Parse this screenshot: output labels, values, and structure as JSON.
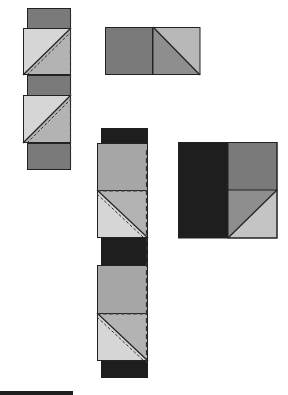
{
  "diagram": {
    "title": "",
    "type": "quilt-assembly-diagram",
    "colors": {
      "black": "#1e1e1e",
      "dark_gray": "#7a7a7a",
      "medium_gray": "#a6a6a6",
      "light_gray": "#d6d6d6",
      "outline": "#222222",
      "dashed_seam": "#333333",
      "background": "#ffffff"
    },
    "units": [
      {
        "name": "left-strip",
        "description": "vertical strip: dark gray bands alternating with half-square triangle blocks, dashed seam line on right edge"
      },
      {
        "name": "top-right-unit",
        "description": "dark gray square joined to half-square triangle (light upper-right, medium lower-left)"
      },
      {
        "name": "middle-strip",
        "description": "vertical strip: black bands alternating with medium gray squares and half-square triangle blocks, dashed seam lines"
      },
      {
        "name": "right-unit",
        "description": "black rectangle beside dark gray square over half-square triangle"
      },
      {
        "name": "bottom-left-bar",
        "description": "black bar at bottom-left edge"
      }
    ]
  }
}
